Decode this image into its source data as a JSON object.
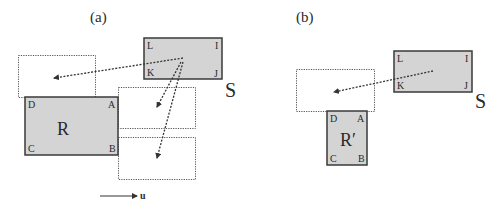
{
  "panels": {
    "a": {
      "label": "(a)",
      "fixed_rect": {
        "name": "R",
        "corners": {
          "D": "D",
          "A": "A",
          "C": "C",
          "B": "B"
        }
      },
      "moving_rect": {
        "name": "S",
        "corners": {
          "L": "L",
          "I": "I",
          "K": "K",
          "J": "J"
        }
      },
      "direction_label": "u"
    },
    "b": {
      "label": "(b)",
      "fixed_rect": {
        "name": "R′",
        "corners": {
          "D": "D",
          "A": "A",
          "C": "C",
          "B": "B"
        }
      },
      "moving_rect": {
        "name": "S",
        "corners": {
          "L": "L",
          "I": "I",
          "K": "K",
          "J": "J"
        }
      }
    }
  },
  "colors": {
    "fill": "#d4d4d4",
    "stroke": "#3a3a3a",
    "dotted": "#555555"
  }
}
